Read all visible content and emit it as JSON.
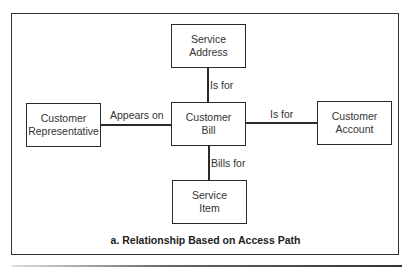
{
  "diagram": {
    "entities": {
      "service_address": [
        "Service",
        "Address"
      ],
      "customer_bill": [
        "Customer",
        "Bill"
      ],
      "customer_representative": [
        "Customer",
        "Representative"
      ],
      "customer_account": [
        "Customer",
        "Account"
      ],
      "service_item": [
        "Service",
        "Item"
      ]
    },
    "relationships": {
      "bill_to_address": "Is for",
      "rep_to_bill": "Appears on",
      "bill_to_account": "Is for",
      "bill_to_item": "Bills for"
    },
    "caption": "a. Relationship Based on Access Path"
  }
}
